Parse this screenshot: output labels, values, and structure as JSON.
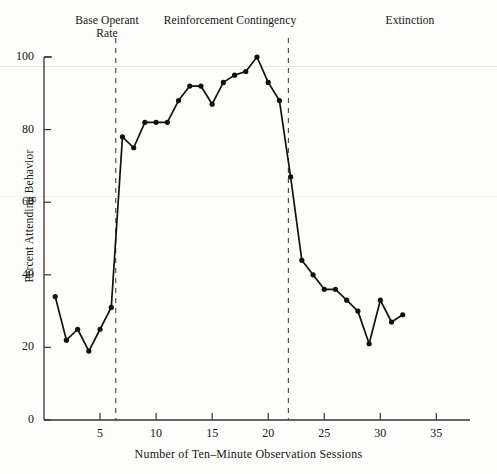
{
  "chart_data": {
    "type": "line",
    "title": "",
    "xlabel": "Number of Ten–Minute Observation Sessions",
    "ylabel": "Percent Attending Behavior",
    "xlim": [
      0,
      38
    ],
    "ylim": [
      0,
      103
    ],
    "xticks": [
      5,
      10,
      15,
      20,
      25,
      30,
      35
    ],
    "yticks": [
      0,
      20,
      40,
      60,
      80,
      100
    ],
    "grid": false,
    "legend": null,
    "marker": "filled-circle",
    "line_color": "#111111",
    "x": [
      1,
      2,
      3,
      4,
      5,
      6,
      7,
      8,
      9,
      10,
      11,
      12,
      13,
      14,
      15,
      16,
      17,
      18,
      19,
      20,
      21,
      22,
      23,
      24,
      25,
      26,
      27,
      28,
      29,
      30,
      31,
      32,
      33,
      34,
      35
    ],
    "values": [
      34,
      22,
      25,
      19,
      25,
      31,
      78,
      75,
      82,
      82,
      82,
      88,
      92,
      92,
      87,
      93,
      95,
      96,
      100,
      93,
      88,
      67,
      44,
      40,
      36,
      36,
      33,
      30,
      21,
      33,
      27,
      29,
      29,
      29,
      29
    ],
    "series": [
      {
        "name": "Percent Attending Behavior",
        "points": [
          {
            "session": 1,
            "percent": 34
          },
          {
            "session": 2,
            "percent": 22
          },
          {
            "session": 3,
            "percent": 25
          },
          {
            "session": 4,
            "percent": 19
          },
          {
            "session": 5,
            "percent": 25
          },
          {
            "session": 6,
            "percent": 31
          },
          {
            "session": 7,
            "percent": 78
          },
          {
            "session": 8,
            "percent": 75
          },
          {
            "session": 9,
            "percent": 82
          },
          {
            "session": 10,
            "percent": 82
          },
          {
            "session": 11,
            "percent": 82
          },
          {
            "session": 12,
            "percent": 88
          },
          {
            "session": 13,
            "percent": 92
          },
          {
            "session": 14,
            "percent": 92
          },
          {
            "session": 15,
            "percent": 87
          },
          {
            "session": 16,
            "percent": 93
          },
          {
            "session": 17,
            "percent": 95
          },
          {
            "session": 18,
            "percent": 96
          },
          {
            "session": 19,
            "percent": 100
          },
          {
            "session": 20,
            "percent": 93
          },
          {
            "session": 21,
            "percent": 88
          },
          {
            "session": 22,
            "percent": 67
          },
          {
            "session": 23,
            "percent": 44
          },
          {
            "session": 24,
            "percent": 40
          },
          {
            "session": 25,
            "percent": 36
          },
          {
            "session": 26,
            "percent": 36
          },
          {
            "session": 27,
            "percent": 33
          },
          {
            "session": 28,
            "percent": 30
          },
          {
            "session": 29,
            "percent": 21
          },
          {
            "session": 30,
            "percent": 33
          },
          {
            "session": 31,
            "percent": 27
          },
          {
            "session": 32,
            "percent": 29
          }
        ]
      }
    ],
    "phases": [
      {
        "id": "base-operant-rate",
        "label": "Base Operant\nRate",
        "start": 0,
        "end": 6.4
      },
      {
        "id": "reinforcement-contingency",
        "label": "Reinforcement Contingency",
        "start": 6.4,
        "end": 21.8
      },
      {
        "id": "extinction",
        "label": "Extinction",
        "start": 21.8,
        "end": 38
      }
    ],
    "phase_dividers": [
      6.4,
      21.8
    ],
    "annotations": []
  }
}
